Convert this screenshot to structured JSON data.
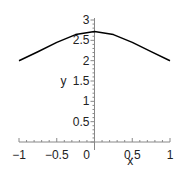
{
  "chart_data": {
    "type": "line",
    "title": "",
    "xlabel": "x",
    "ylabel": "y",
    "xlim": [
      -1,
      1
    ],
    "ylim": [
      0,
      3
    ],
    "grid": false,
    "legend": null,
    "x_ticks": [
      "-1",
      "-0.5",
      "0",
      "0.5",
      "1"
    ],
    "y_ticks": [
      "0.5",
      "1",
      "1.5",
      "2",
      "2.5",
      "3"
    ],
    "series": [
      {
        "name": "curve",
        "color": "#000000",
        "x": [
          -1,
          -0.75,
          -0.5,
          -0.25,
          0,
          0.25,
          0.5,
          0.75,
          1
        ],
        "y": [
          2.0,
          2.22,
          2.45,
          2.64,
          2.72,
          2.64,
          2.45,
          2.22,
          2.0
        ]
      }
    ]
  }
}
